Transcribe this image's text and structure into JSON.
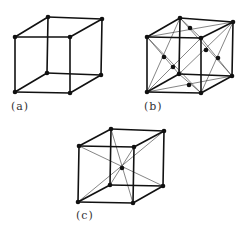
{
  "figures": [
    {
      "id": "a",
      "label": "(a)",
      "type": "simple-cubic",
      "vertices": {
        "btl": [
          48,
          17
        ],
        "btr": [
          102,
          19
        ],
        "ftl": [
          15,
          37
        ],
        "ftr": [
          70,
          37
        ],
        "bbl": [
          47,
          73
        ],
        "bbr": [
          101,
          75
        ],
        "fbl": [
          15,
          92
        ],
        "fbr": [
          70,
          93
        ]
      },
      "extra_points": [],
      "thin_lines": []
    },
    {
      "id": "b",
      "label": "(b)",
      "type": "face-centered-cubic",
      "vertices": {
        "btl": [
          180,
          18
        ],
        "btr": [
          233,
          22
        ],
        "ftl": [
          147,
          37
        ],
        "ftr": [
          201,
          38
        ],
        "bbl": [
          179,
          74
        ],
        "bbr": [
          232,
          76
        ],
        "fbl": [
          147,
          92
        ],
        "fbr": [
          201,
          93
        ]
      },
      "extra_points": [
        [
          164,
          57
        ],
        [
          173,
          67
        ],
        [
          190,
          28
        ],
        [
          206,
          50
        ],
        [
          218,
          58
        ],
        [
          189,
          85
        ]
      ],
      "thin_lines": [
        [
          "ftl",
          "fbr"
        ],
        [
          "ftr",
          "fbl"
        ],
        [
          "btl",
          "fbl"
        ],
        [
          "ftl",
          "bbl"
        ],
        [
          "ftr",
          "bbr"
        ],
        [
          "btr",
          "fbr"
        ],
        [
          "ftl",
          "btr"
        ],
        [
          "btl",
          "ftr"
        ],
        [
          "fbl",
          "bbr"
        ],
        [
          "bbl",
          "fbr"
        ],
        [
          "btl",
          "bbr"
        ],
        [
          "btr",
          "bbl"
        ]
      ]
    },
    {
      "id": "c",
      "label": "(c)",
      "type": "body-centered-cubic",
      "vertices": {
        "btl": [
          111,
          129
        ],
        "btr": [
          164,
          131
        ],
        "ftl": [
          79,
          146
        ],
        "ftr": [
          134,
          147
        ],
        "bbl": [
          110,
          185
        ],
        "bbr": [
          163,
          186
        ],
        "fbl": [
          78,
          202
        ],
        "fbr": [
          133,
          203
        ]
      },
      "extra_points": [
        [
          122,
          168
        ]
      ],
      "thin_lines": [
        [
          "ftl",
          "bbr"
        ],
        [
          "btr",
          "fbl"
        ],
        [
          "btl",
          "fbr"
        ],
        [
          "ftr",
          "bbl"
        ]
      ]
    }
  ],
  "labels": {
    "a": {
      "text": "(a)",
      "x": 11,
      "y": 100
    },
    "b": {
      "text": "(b)",
      "x": 144,
      "y": 100
    },
    "c": {
      "text": "(c)",
      "x": 76,
      "y": 209
    }
  },
  "colors": {
    "ink": "#111111",
    "thin": "#333333"
  }
}
